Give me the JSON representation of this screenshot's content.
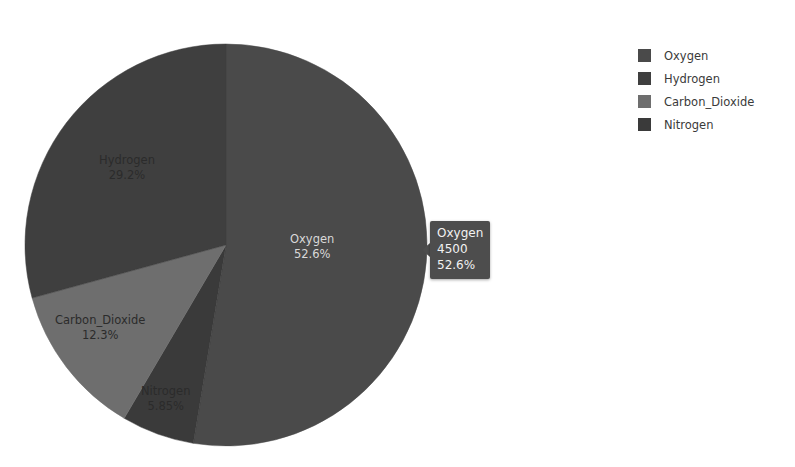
{
  "chart_data": {
    "type": "pie",
    "title": "",
    "categories": [
      "Oxygen",
      "Hydrogen",
      "Carbon_Dioxide",
      "Nitrogen"
    ],
    "values": [
      4500,
      2500,
      1050,
      500
    ],
    "percentages": [
      "52.6%",
      "29.2%",
      "12.3%",
      "5.85%"
    ],
    "percent_numeric": [
      52.6,
      29.2,
      12.3,
      5.85
    ],
    "legend_position": "right",
    "grid": false,
    "start_angle_clock": "12 o'clock",
    "direction": "clockwise",
    "draw_order_clockwise": [
      "Oxygen",
      "Nitrogen",
      "Carbon_Dioxide",
      "Hydrogen"
    ],
    "colors": [
      "#4a4a4a",
      "#3f3f3f",
      "#6e6e6e",
      "#3a3a3a"
    ]
  },
  "pie": {
    "center_x": 226,
    "center_y": 245,
    "radius": 201,
    "slices": [
      {
        "name": "Oxygen",
        "percent_label": "52.6%",
        "value": 4500,
        "color": "#4a4a4a",
        "label_tone": "label-light",
        "label_left": 290,
        "label_top": 232,
        "start_deg": 0,
        "sweep_deg": 189.36
      },
      {
        "name": "Nitrogen",
        "percent_label": "5.85%",
        "value": 500,
        "color": "#3a3a3a",
        "label_tone": "label-dark",
        "label_left": 141,
        "label_top": 384,
        "start_deg": 189.36,
        "sweep_deg": 21.06
      },
      {
        "name": "Carbon_Dioxide",
        "percent_label": "12.3%",
        "value": 1050,
        "color": "#6e6e6e",
        "label_tone": "label-dark",
        "label_left": 55,
        "label_top": 313,
        "start_deg": 210.42,
        "sweep_deg": 44.28
      },
      {
        "name": "Hydrogen",
        "percent_label": "29.2%",
        "value": 2500,
        "color": "#3f3f3f",
        "label_tone": "label-dark",
        "label_left": 99,
        "label_top": 153,
        "start_deg": 254.7,
        "sweep_deg": 105.3
      }
    ]
  },
  "tooltip": {
    "visible": true,
    "left": 430,
    "top": 221,
    "series": "Oxygen",
    "value": "4500",
    "percent": "52.6%"
  },
  "legend": {
    "items": [
      {
        "label": "Oxygen",
        "color": "#4a4a4a"
      },
      {
        "label": "Hydrogen",
        "color": "#3f3f3f"
      },
      {
        "label": "Carbon_Dioxide",
        "color": "#6e6e6e"
      },
      {
        "label": "Nitrogen",
        "color": "#3a3a3a"
      }
    ]
  }
}
